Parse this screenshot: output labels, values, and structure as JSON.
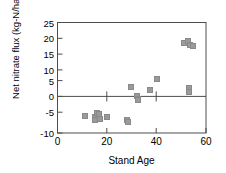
{
  "chart_data": {
    "type": "scatter",
    "title": "",
    "xlabel": "Stand Age",
    "ylabel": "Net nitrate flux (kg-N/ha/y)",
    "xlim": [
      0,
      60
    ],
    "ylim": [
      -10,
      25
    ],
    "xticks": [
      0,
      20,
      40,
      60
    ],
    "yticks": [
      -10,
      -5,
      0,
      5,
      10,
      15,
      20,
      25
    ],
    "xtick_labels": [
      "0",
      "20",
      "40",
      "60"
    ],
    "ytick_labels": [
      "-10",
      "-5",
      "0",
      "5",
      "10",
      "15",
      "20",
      "25"
    ],
    "grid": false,
    "legend": null,
    "zero_line": 0,
    "marker": {
      "shape": "square",
      "color": "#9a9a9a",
      "edge_color": "#8a8a8a"
    },
    "series": [
      {
        "name": "Net nitrate flux vs stand age",
        "points": [
          {
            "x": 11.0,
            "y": -4.5
          },
          {
            "x": 15.0,
            "y": -5.0
          },
          {
            "x": 15.3,
            "y": -5.8
          },
          {
            "x": 16.0,
            "y": -3.6
          },
          {
            "x": 16.6,
            "y": -4.0
          },
          {
            "x": 17.0,
            "y": -5.5
          },
          {
            "x": 20.0,
            "y": -4.8
          },
          {
            "x": 28.0,
            "y": -6.0
          },
          {
            "x": 28.6,
            "y": -6.6
          },
          {
            "x": 29.8,
            "y": 4.6
          },
          {
            "x": 32.0,
            "y": 1.8
          },
          {
            "x": 32.4,
            "y": 0.9
          },
          {
            "x": 32.6,
            "y": 0.4
          },
          {
            "x": 37.2,
            "y": 3.5
          },
          {
            "x": 40.3,
            "y": 7.0
          },
          {
            "x": 51.0,
            "y": 18.4
          },
          {
            "x": 52.7,
            "y": 19.0
          },
          {
            "x": 53.4,
            "y": 18.0
          },
          {
            "x": 54.6,
            "y": 17.7
          },
          {
            "x": 53.0,
            "y": 4.3
          },
          {
            "x": 53.1,
            "y": 3.0
          }
        ]
      }
    ]
  },
  "axes": {
    "x_axis_name": "stand-age-axis",
    "y_axis_name": "net-nitrate-flux-axis"
  }
}
